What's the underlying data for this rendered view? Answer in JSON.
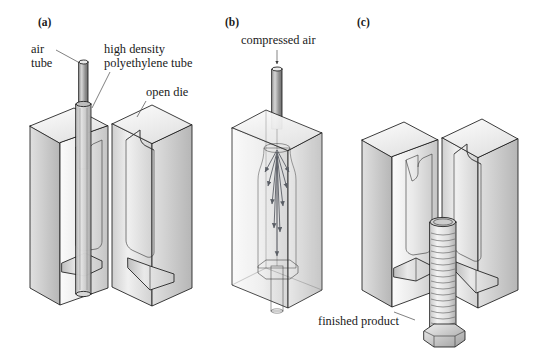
{
  "figure": {
    "background_color": "#ffffff",
    "ink_color": "#1a1a1a"
  },
  "panels": [
    {
      "id": "a",
      "letter": "(a)",
      "description": "Open die with air tube and high density polyethylene tube inserted between the two halves",
      "labels": [
        {
          "name": "air-tube",
          "line1": "air",
          "line2": "tube"
        },
        {
          "name": "high-density-polyethylene-tube",
          "line1": "high density",
          "line2": "polyethylene tube"
        },
        {
          "name": "open-die",
          "line1": "open die",
          "line2": ""
        }
      ]
    },
    {
      "id": "b",
      "letter": "(b)",
      "description": "Closed die with compressed air inflating the parison against the mold cavity",
      "labels": [
        {
          "name": "compressed-air",
          "line1": "compressed air",
          "line2": ""
        }
      ]
    },
    {
      "id": "c",
      "letter": "(c)",
      "description": "Reopened die releasing the finished ribbed product with octagonal base",
      "labels": [
        {
          "name": "finished-product",
          "line1": "finished product",
          "line2": ""
        }
      ]
    }
  ],
  "colors": {
    "die_light": "#f2f2f2",
    "die_mid": "#d8d8d8",
    "die_dark": "#a8a8a8",
    "die_top": "#ededed",
    "tube_air": "#8f8f8f",
    "tube_parison": "#cccccc",
    "product": "#e4e4e4",
    "arrow": "#5b5f66",
    "outline": "#1a1a1a"
  }
}
